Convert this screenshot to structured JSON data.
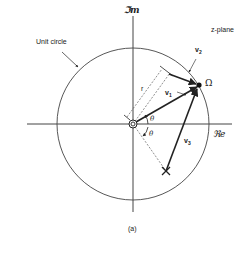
{
  "figure": {
    "plane_label": "z-plane",
    "imag_axis_label": "ℑm",
    "real_axis_label": "ℜe",
    "unit_circle_label": "Unit circle",
    "caption": "(a)",
    "point_label": "Ω",
    "radius_label": "r",
    "angle_label_upper": "θ",
    "angle_label_lower": "θ",
    "vectors": [
      {
        "name": "v1",
        "label": "v",
        "sub": "1"
      },
      {
        "name": "v2",
        "label": "v",
        "sub": "2"
      },
      {
        "name": "v3",
        "label": "v",
        "sub": "3"
      }
    ],
    "markers": {
      "zero": "double circle at origin",
      "pole": "X"
    }
  },
  "colors": {
    "stroke": "#222222",
    "background": "#ffffff"
  }
}
